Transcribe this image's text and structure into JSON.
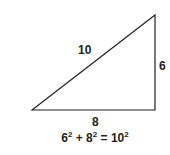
{
  "diagram": {
    "type": "right-triangle",
    "sides": {
      "hypotenuse": "10",
      "vertical_leg": "6",
      "horizontal_leg": "8"
    },
    "equation": {
      "a_base": "6",
      "a_exp": "2",
      "plus": "+",
      "b_base": "8",
      "b_exp": "2",
      "equals": "=",
      "c_base": "10",
      "c_exp": "2"
    },
    "colors": {
      "stroke": "#231f20",
      "text": "#231f20",
      "background": "#ffffff"
    }
  }
}
